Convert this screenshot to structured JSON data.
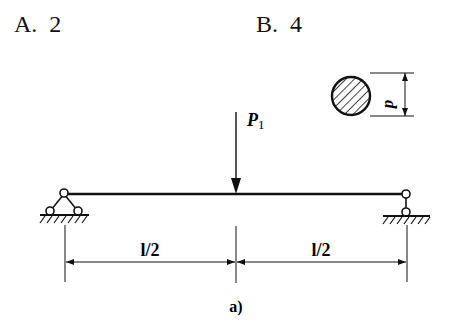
{
  "options": [
    {
      "letter": "A.",
      "value": "2"
    },
    {
      "letter": "B.",
      "value": "4"
    }
  ],
  "diagram": {
    "load_label": "P",
    "load_subscript": "1",
    "diameter_label": "d",
    "span_left_label": "l/2",
    "span_right_label": "l/2",
    "caption": "a)",
    "left_support": "pin-support",
    "right_support": "roller-support",
    "cross_section": "solid-circle"
  }
}
